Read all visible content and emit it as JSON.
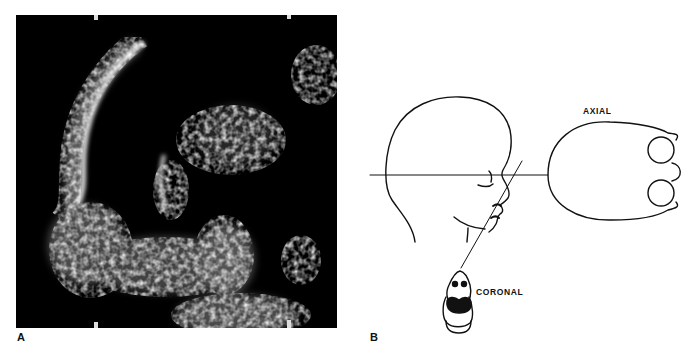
{
  "figure": {
    "panel_a": {
      "label": "A",
      "description": "Sagittal ultrasound image of fetal face profile"
    },
    "panel_b": {
      "label": "B",
      "description": "Schematic of imaging planes of fetal head",
      "plane_labels": {
        "axial": "AXIAL",
        "coronal": "CORONAL"
      }
    }
  }
}
